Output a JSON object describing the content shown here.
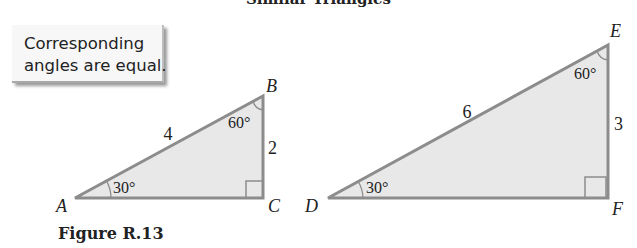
{
  "title": "Similar Triangles",
  "callout": {
    "text": "Corresponding\nangles are equal."
  },
  "caption": "Figure R.13",
  "colors": {
    "fill": "#e8e8e8",
    "stroke": "#8c8c8c",
    "text": "#222222"
  },
  "triangles": [
    {
      "name": "ABC",
      "vertices": {
        "A": "A",
        "B": "B",
        "C": "C"
      },
      "sides": {
        "AB": "4",
        "BC": "2"
      },
      "angles": {
        "A": "30°",
        "B": "60°",
        "C": "right angle"
      }
    },
    {
      "name": "DEF",
      "vertices": {
        "D": "D",
        "E": "E",
        "F": "F"
      },
      "sides": {
        "DE": "6",
        "EF": "3"
      },
      "angles": {
        "D": "30°",
        "E": "60°",
        "F": "right angle"
      }
    }
  ]
}
